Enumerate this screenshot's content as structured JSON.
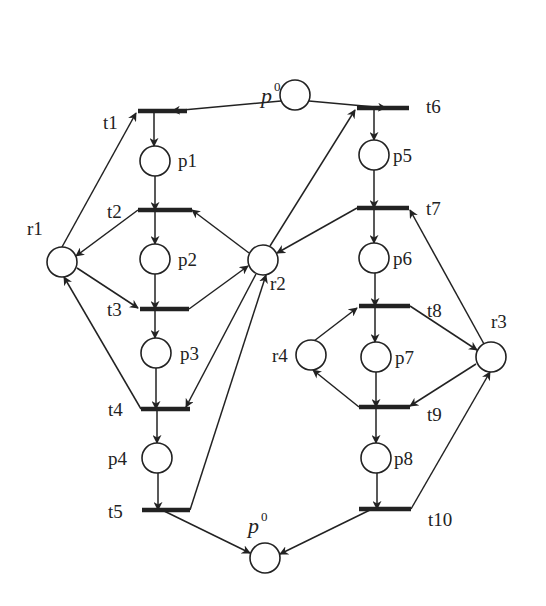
{
  "diagram": {
    "type": "petri-net",
    "colors": {
      "stroke": "#222222",
      "background": "#ffffff"
    },
    "places": [
      {
        "id": "p0_top",
        "label": "p",
        "sup": "0",
        "x": 295,
        "y": 95,
        "lx": 261,
        "ly": 103
      },
      {
        "id": "p1",
        "label": "p1",
        "x": 155,
        "y": 161,
        "lx": 178,
        "ly": 167
      },
      {
        "id": "p2",
        "label": "p2",
        "x": 155,
        "y": 259,
        "lx": 178,
        "ly": 266
      },
      {
        "id": "p3",
        "label": "p3",
        "x": 156,
        "y": 353,
        "lx": 180,
        "ly": 360
      },
      {
        "id": "p4",
        "label": "p4",
        "x": 157,
        "y": 458,
        "lx": 108,
        "ly": 465
      },
      {
        "id": "p5",
        "label": "p5",
        "x": 374,
        "y": 155,
        "lx": 393,
        "ly": 162
      },
      {
        "id": "p6",
        "label": "p6",
        "x": 374,
        "y": 258,
        "lx": 393,
        "ly": 265
      },
      {
        "id": "p7",
        "label": "p7",
        "x": 376,
        "y": 357,
        "lx": 395,
        "ly": 364
      },
      {
        "id": "p8",
        "label": "p8",
        "x": 376,
        "y": 458,
        "lx": 394,
        "ly": 465
      },
      {
        "id": "r1",
        "label": "r1",
        "x": 62,
        "y": 262,
        "lx": 27,
        "ly": 235
      },
      {
        "id": "r2",
        "label": "r2",
        "x": 263,
        "y": 260,
        "lx": 270,
        "ly": 290
      },
      {
        "id": "r3",
        "label": "r3",
        "x": 491,
        "y": 357,
        "lx": 491,
        "ly": 328
      },
      {
        "id": "r4",
        "label": "r4",
        "x": 311,
        "y": 355,
        "lx": 272,
        "ly": 362
      },
      {
        "id": "p0_bottom",
        "label": "p",
        "sup": "0",
        "x": 265,
        "y": 558,
        "lx": 248,
        "ly": 533
      }
    ],
    "transitions": [
      {
        "id": "t1",
        "label": "t1",
        "x1": 138,
        "x2": 187,
        "y": 111,
        "lx": 103,
        "ly": 129
      },
      {
        "id": "t2",
        "label": "t2",
        "x1": 138,
        "x2": 192,
        "y": 210,
        "lx": 107,
        "ly": 218
      },
      {
        "id": "t3",
        "label": "t3",
        "x1": 140,
        "x2": 189,
        "y": 309,
        "lx": 107,
        "ly": 316
      },
      {
        "id": "t4",
        "label": "t4",
        "x1": 141,
        "x2": 190,
        "y": 409,
        "lx": 108,
        "ly": 416
      },
      {
        "id": "t5",
        "label": "t5",
        "x1": 142,
        "x2": 190,
        "y": 510,
        "lx": 108,
        "ly": 518
      },
      {
        "id": "t6",
        "label": "t6",
        "x1": 357,
        "x2": 409,
        "y": 108,
        "lx": 426,
        "ly": 113
      },
      {
        "id": "t7",
        "label": "t7",
        "x1": 357,
        "x2": 409,
        "y": 208,
        "lx": 426,
        "ly": 215
      },
      {
        "id": "t8",
        "label": "t8",
        "x1": 359,
        "x2": 410,
        "y": 306,
        "lx": 427,
        "ly": 317
      },
      {
        "id": "t9",
        "label": "t9",
        "x1": 359,
        "x2": 410,
        "y": 407,
        "lx": 427,
        "ly": 421
      },
      {
        "id": "t10",
        "label": "t10",
        "x1": 359,
        "x2": 411,
        "y": 509,
        "lx": 428,
        "ly": 526
      }
    ],
    "arcs": [
      {
        "from": "p0_top",
        "to": "t1",
        "x1": 281,
        "y1": 101,
        "x2": 172,
        "y2": 111
      },
      {
        "from": "p0_top",
        "to": "t6",
        "x1": 309,
        "y1": 101,
        "x2": 386,
        "y2": 108
      },
      {
        "from": "t1",
        "to": "p1",
        "x1": 154,
        "y1": 111,
        "x2": 154,
        "y2": 146
      },
      {
        "from": "p1",
        "to": "t2",
        "x1": 155,
        "y1": 176,
        "x2": 155,
        "y2": 210
      },
      {
        "from": "t2",
        "to": "p2",
        "x1": 155,
        "y1": 210,
        "x2": 155,
        "y2": 244
      },
      {
        "from": "p2",
        "to": "t3",
        "x1": 155,
        "y1": 274,
        "x2": 155,
        "y2": 309
      },
      {
        "from": "t3",
        "to": "p3",
        "x1": 155,
        "y1": 309,
        "x2": 155,
        "y2": 338
      },
      {
        "from": "p3",
        "to": "t4",
        "x1": 156,
        "y1": 368,
        "x2": 156,
        "y2": 409
      },
      {
        "from": "t4",
        "to": "p4",
        "x1": 157,
        "y1": 409,
        "x2": 157,
        "y2": 443
      },
      {
        "from": "p4",
        "to": "t5",
        "x1": 158,
        "y1": 473,
        "x2": 158,
        "y2": 510
      },
      {
        "from": "t5",
        "to": "p0_bottom",
        "x1": 162,
        "y1": 510,
        "x2": 250,
        "y2": 553
      },
      {
        "from": "r1",
        "to": "t1",
        "x1": 62,
        "y1": 247,
        "x2": 136,
        "y2": 113
      },
      {
        "from": "t2",
        "to": "r1",
        "x1": 138,
        "y1": 210,
        "x2": 76,
        "y2": 256
      },
      {
        "from": "r1",
        "to": "t3",
        "x1": 77,
        "y1": 268,
        "x2": 138,
        "y2": 308
      },
      {
        "from": "t4",
        "to": "r1",
        "x1": 141,
        "y1": 409,
        "x2": 64,
        "y2": 277
      },
      {
        "from": "r2",
        "to": "t2",
        "x1": 249,
        "y1": 253,
        "x2": 192,
        "y2": 210
      },
      {
        "from": "t3",
        "to": "r2",
        "x1": 189,
        "y1": 309,
        "x2": 248,
        "y2": 266
      },
      {
        "from": "r2",
        "to": "t4",
        "x1": 256,
        "y1": 274,
        "x2": 186,
        "y2": 407
      },
      {
        "from": "t5",
        "to": "r2",
        "x1": 190,
        "y1": 510,
        "x2": 266,
        "y2": 275
      },
      {
        "from": "r2",
        "to": "t6",
        "x1": 270,
        "y1": 246,
        "x2": 355,
        "y2": 110
      },
      {
        "from": "t7",
        "to": "r2",
        "x1": 357,
        "y1": 208,
        "x2": 277,
        "y2": 253
      },
      {
        "from": "t6",
        "to": "p5",
        "x1": 374,
        "y1": 108,
        "x2": 374,
        "y2": 140
      },
      {
        "from": "p5",
        "to": "t7",
        "x1": 374,
        "y1": 170,
        "x2": 374,
        "y2": 208
      },
      {
        "from": "t7",
        "to": "p6",
        "x1": 374,
        "y1": 208,
        "x2": 374,
        "y2": 243
      },
      {
        "from": "p6",
        "to": "t8",
        "x1": 375,
        "y1": 273,
        "x2": 375,
        "y2": 306
      },
      {
        "from": "t8",
        "to": "p7",
        "x1": 375,
        "y1": 306,
        "x2": 375,
        "y2": 342
      },
      {
        "from": "p7",
        "to": "t9",
        "x1": 376,
        "y1": 372,
        "x2": 376,
        "y2": 407
      },
      {
        "from": "t9",
        "to": "p8",
        "x1": 376,
        "y1": 407,
        "x2": 376,
        "y2": 443
      },
      {
        "from": "p8",
        "to": "t10",
        "x1": 377,
        "y1": 473,
        "x2": 377,
        "y2": 509
      },
      {
        "from": "t10",
        "to": "p0_bottom",
        "x1": 372,
        "y1": 509,
        "x2": 280,
        "y2": 554
      },
      {
        "from": "r3",
        "to": "t7",
        "x1": 484,
        "y1": 344,
        "x2": 410,
        "y2": 210
      },
      {
        "from": "t8",
        "to": "r3",
        "x1": 410,
        "y1": 306,
        "x2": 477,
        "y2": 350
      },
      {
        "from": "r3",
        "to": "t9",
        "x1": 476,
        "y1": 364,
        "x2": 410,
        "y2": 406
      },
      {
        "from": "t10",
        "to": "r3",
        "x1": 411,
        "y1": 509,
        "x2": 490,
        "y2": 372
      },
      {
        "from": "r4",
        "to": "t8",
        "x1": 314,
        "y1": 341,
        "x2": 357,
        "y2": 308
      },
      {
        "from": "t9",
        "to": "r4",
        "x1": 359,
        "y1": 407,
        "x2": 313,
        "y2": 370
      }
    ]
  }
}
